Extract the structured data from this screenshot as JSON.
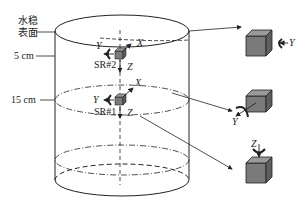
{
  "labels": {
    "water_surface_line1": "水稳",
    "water_surface_line2": "表面",
    "depth_5": "5 cm",
    "depth_15": "15 cm",
    "sensor2": "SR#2",
    "sensor1": "SR#1",
    "axis_x": "X",
    "axis_y": "Y",
    "axis_z": "Z"
  },
  "insets": [
    {
      "rotation_axis": "Y",
      "position": "right"
    },
    {
      "rotation_axis": "Y",
      "position": "bottom-left"
    },
    {
      "rotation_axis": "Z",
      "position": "top"
    }
  ],
  "colors": {
    "line": "#222222",
    "cube_front": "#7a7a7a",
    "cube_top": "#9a9a9a",
    "cube_side": "#5e5e5e"
  }
}
